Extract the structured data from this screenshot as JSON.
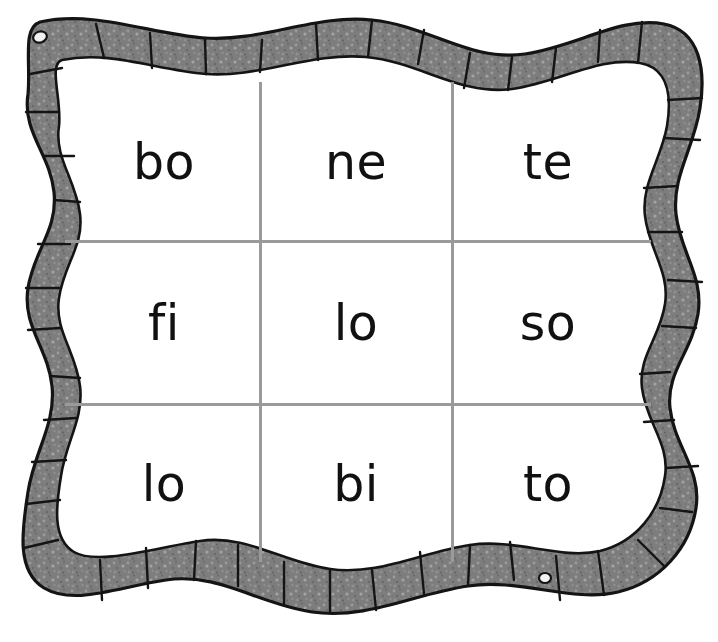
{
  "page": {
    "background_color": "#ffffff"
  },
  "frame": {
    "name": "worm-border-frame",
    "description": "hand-drawn segmented worm border",
    "fill_color": "#7d7d7d",
    "outline_color": "#1a1a1a",
    "segment_line_color": "#1a1a1a",
    "eye_fill_color": "#f2f2f2",
    "eyes": [
      {
        "label": "head-eye",
        "cx": 40,
        "cy": 37,
        "rx": 7,
        "ry": 5.5
      },
      {
        "label": "tail-eye",
        "cx": 545,
        "cy": 578,
        "rx": 6,
        "ry": 5
      }
    ]
  },
  "grid": {
    "line_color": "#9a9a9a",
    "rows": 3,
    "columns": 3,
    "cells": [
      [
        {
          "text": "bo",
          "name": "cell-r1c1"
        },
        {
          "text": "ne",
          "name": "cell-r1c2"
        },
        {
          "text": "te",
          "name": "cell-r1c3"
        }
      ],
      [
        {
          "text": "fi",
          "name": "cell-r2c1"
        },
        {
          "text": "lo",
          "name": "cell-r2c2"
        },
        {
          "text": "so",
          "name": "cell-r2c3"
        }
      ],
      [
        {
          "text": "lo",
          "name": "cell-r3c1"
        },
        {
          "text": "bi",
          "name": "cell-r3c2"
        },
        {
          "text": "to",
          "name": "cell-r3c3"
        }
      ]
    ]
  }
}
